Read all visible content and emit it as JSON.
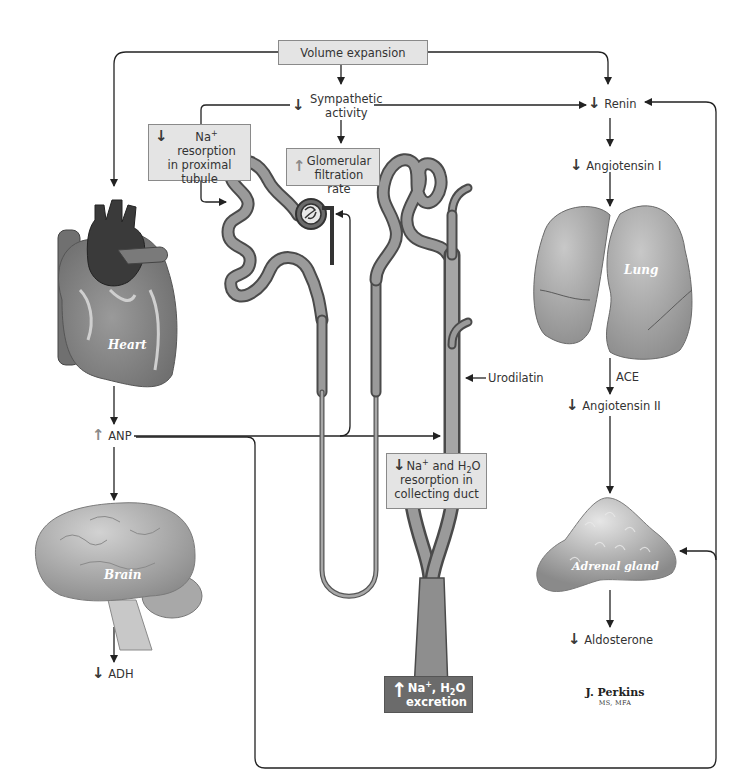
{
  "diagram": {
    "type": "physiological feedback diagram",
    "colors": {
      "background": "#ffffff",
      "box_fill": "#e4e4e4",
      "box_dark_fill": "#6b6b6b",
      "line": "#222222",
      "organ_gray": "#8c8c8c",
      "increase_arrow": "#8a8a8a",
      "decrease_arrow": "#3a3a3a"
    }
  },
  "nodes": {
    "volume_expansion": {
      "text": "Volume expansion"
    },
    "sympathetic": {
      "direction": "decrease",
      "line1": "Sympathetic",
      "line2": "activity"
    },
    "na_proximal": {
      "direction": "decrease",
      "line1": "Na",
      "sup": "+",
      "line1b": " resorption",
      "line2": "in proximal",
      "line3": "tubule"
    },
    "gfr": {
      "direction": "increase",
      "line1": "Glomerular",
      "line2": "filtration rate"
    },
    "renin": {
      "direction": "decrease",
      "text": "Renin"
    },
    "angiotensin_1": {
      "direction": "decrease",
      "text": "Angiotensin I"
    },
    "ace": {
      "text": "ACE"
    },
    "angiotensin_2": {
      "direction": "decrease",
      "text": "Angiotensin II"
    },
    "aldosterone": {
      "direction": "decrease",
      "text": "Aldosterone"
    },
    "anp": {
      "direction": "increase",
      "text": "ANP"
    },
    "adh": {
      "direction": "decrease",
      "text": "ADH"
    },
    "urodilatin": {
      "text": "Urodilatin"
    },
    "collecting_duct": {
      "direction": "decrease",
      "line1a": "Na",
      "sup": "+",
      "line1b": " and H",
      "sub": "2",
      "line1c": "O",
      "line2": "resorption in",
      "line3": "collecting duct"
    },
    "excretion": {
      "direction": "increase",
      "line1a": "Na",
      "sup": "+",
      "line1b": ", H",
      "sub": "2",
      "line1c": "O",
      "line2": "excretion"
    }
  },
  "organs": {
    "heart": "Heart",
    "brain": "Brain",
    "lung": "Lung",
    "adrenal": "Adrenal gland",
    "kidney_nephron": "Nephron"
  },
  "signature": {
    "name": "J. Perkins",
    "credentials": "MS, MFA"
  },
  "arrow_glyphs": {
    "down": "↓",
    "up": "↑",
    "left": "←",
    "right": "→"
  }
}
